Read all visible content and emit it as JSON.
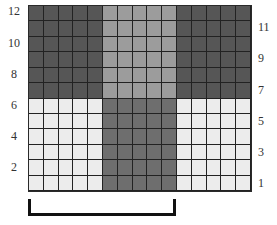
{
  "diagram": {
    "type": "color-block-grid",
    "columns": 15,
    "rows": 12,
    "colors": {
      "dark": "#565656",
      "medium": "#9c9c9c",
      "medium_dark": "#6e6e6e",
      "light": "#ececec",
      "grid_line": "#222222"
    },
    "blocks": [
      {
        "rows": "7-12",
        "cols": "1-5",
        "color": "dark"
      },
      {
        "rows": "7-12",
        "cols": "6-10",
        "color": "medium"
      },
      {
        "rows": "7-12",
        "cols": "11-15",
        "color": "dark"
      },
      {
        "rows": "1-6",
        "cols": "1-5",
        "color": "light"
      },
      {
        "rows": "1-6",
        "cols": "6-10",
        "color": "medium_dark"
      },
      {
        "rows": "1-6",
        "cols": "11-15",
        "color": "light"
      }
    ],
    "left_labels": [
      {
        "text": "12",
        "top": 0
      },
      {
        "text": "10",
        "top": 32
      },
      {
        "text": "8",
        "top": 63
      },
      {
        "text": "6",
        "top": 94
      },
      {
        "text": "4",
        "top": 125
      },
      {
        "text": "2",
        "top": 156
      }
    ],
    "right_labels": [
      {
        "text": "11",
        "top": 16
      },
      {
        "text": "9",
        "top": 47
      },
      {
        "text": "7",
        "top": 79
      },
      {
        "text": "5",
        "top": 110
      },
      {
        "text": "3",
        "top": 141
      },
      {
        "text": "1",
        "top": 172
      }
    ],
    "bracket": {
      "span_cols": "1-10"
    }
  }
}
